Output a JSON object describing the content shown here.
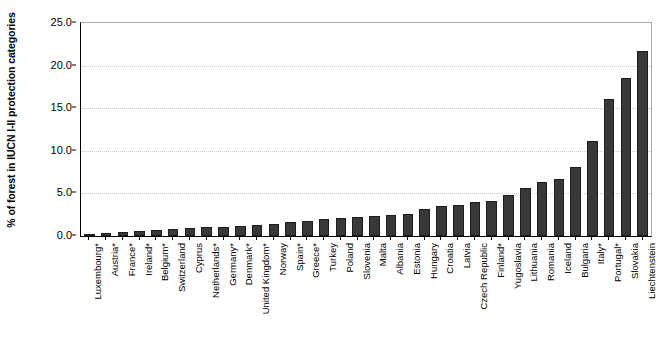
{
  "chart_data": {
    "type": "bar",
    "title": "",
    "subtitle": "",
    "xlabel": "",
    "ylabel": "% of forest in IUCN I-II protection categories",
    "ylim": [
      0.0,
      25.0
    ],
    "yticks": [
      "0.0",
      "5.0",
      "10.0",
      "15.0",
      "20.0",
      "25.0"
    ],
    "ytick_values": [
      0.0,
      5.0,
      10.0,
      15.0,
      20.0,
      25.0
    ],
    "grid": true,
    "legend": "none",
    "bar_color": "#383838",
    "categories": [
      "Luxembourg*",
      "Austria*",
      "France*",
      "Ireland*",
      "Belgium*",
      "Switzerland",
      "Cyprus",
      "Netherlands*",
      "Germany*",
      "Denmark*",
      "United Kingdom*",
      "Norway",
      "Spain*",
      "Greece*",
      "Turkey",
      "Poland",
      "Slovenia",
      "Malta",
      "Albania",
      "Estonia",
      "Hungary",
      "Croatia",
      "Latvia",
      "Czech Republic",
      "Finland*",
      "Yugoslavia",
      "Lithuania",
      "Romania",
      "Iceland",
      "Bulgaria",
      "Italy*",
      "Portugal*",
      "Slovakia",
      "Liechtenstein"
    ],
    "values": [
      0.1,
      0.3,
      0.5,
      0.6,
      0.7,
      0.8,
      0.9,
      1.0,
      1.1,
      1.2,
      1.3,
      1.4,
      1.6,
      1.8,
      2.0,
      2.1,
      2.2,
      2.4,
      2.5,
      2.6,
      3.2,
      3.5,
      3.6,
      4.0,
      4.1,
      4.8,
      5.6,
      6.3,
      6.7,
      8.1,
      11.2,
      16.1,
      18.6,
      21.7
    ]
  }
}
